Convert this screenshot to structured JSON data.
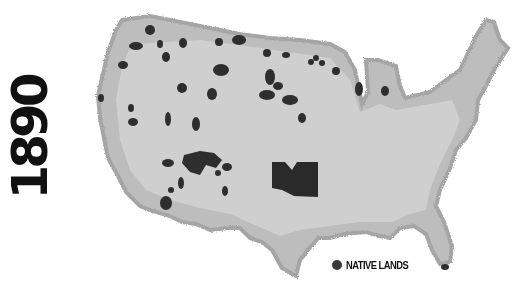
{
  "title": {
    "year": "1890"
  },
  "legend": {
    "label": "NATIVE LANDS",
    "color": "#3a3a3a"
  },
  "colors": {
    "land": "#c9c9c9",
    "coast": "#a9a9a9",
    "native_lands": "#2e2e2e",
    "background": "#ffffff"
  },
  "map": {
    "subject": "Contiguous United States",
    "layer": "Native lands (1890)"
  }
}
